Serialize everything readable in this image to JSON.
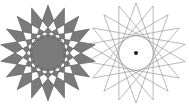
{
  "diagram": {
    "left_star": {
      "points": 18,
      "step": 7,
      "cx": 48,
      "cy": 53,
      "r": 48,
      "fill": "#7a7a7a",
      "stroke": "#555555",
      "fill_rule": "evenodd"
    },
    "right_star": {
      "points": 18,
      "step": 7,
      "cx": 136,
      "cy": 53,
      "r": 50,
      "fill": "none",
      "stroke": "#8a8a8a",
      "center_dot": true
    }
  }
}
